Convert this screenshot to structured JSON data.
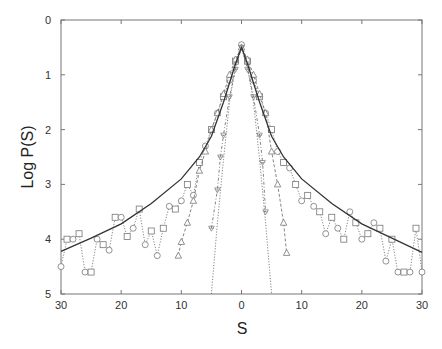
{
  "chart_data": {
    "type": "line",
    "title": "",
    "xlabel": "S",
    "ylabel": "Log P(S)",
    "xlim": [
      -30,
      30
    ],
    "ylim": [
      0,
      5
    ],
    "y_inverted": true,
    "x_tick_values": [
      -30,
      -20,
      -10,
      0,
      10,
      20,
      30
    ],
    "x_tick_labels": [
      "30",
      "20",
      "10",
      "0",
      "10",
      "20",
      "30"
    ],
    "y_tick_values": [
      0,
      1,
      2,
      3,
      4,
      5
    ],
    "y_tick_labels": [
      "0",
      "1",
      "2",
      "3",
      "4",
      "5"
    ],
    "grid": false,
    "legend": null,
    "series": [
      {
        "name": "fit (solid line)",
        "style": "solid",
        "marker": "none",
        "x": [
          -30,
          -25,
          -20,
          -15,
          -10,
          -7,
          -5,
          -3,
          -2,
          -1,
          0,
          1,
          2,
          3,
          5,
          7,
          10,
          15,
          20,
          25,
          30
        ],
        "y": [
          4.22,
          3.98,
          3.72,
          3.35,
          2.9,
          2.5,
          2.12,
          1.5,
          1.15,
          0.8,
          0.5,
          0.8,
          1.15,
          1.5,
          2.12,
          2.5,
          2.9,
          3.35,
          3.72,
          3.98,
          4.24
        ]
      },
      {
        "name": "circles/squares data",
        "style": "dotted",
        "marker": "circle-square",
        "x": [
          -30,
          -29,
          -28,
          -27,
          -26,
          -25,
          -24,
          -23,
          -22,
          -21,
          -20,
          -19,
          -18,
          -17,
          -16,
          -15,
          -14,
          -13,
          -12,
          -11,
          -10,
          -9,
          -8,
          -7,
          -6,
          -5,
          -4,
          -3,
          -2,
          -1,
          0,
          1,
          2,
          3,
          4,
          5,
          6,
          7,
          8,
          9,
          10,
          11,
          12,
          13,
          14,
          15,
          16,
          17,
          18,
          19,
          20,
          21,
          22,
          23,
          24,
          25,
          26,
          27,
          28,
          29,
          30
        ],
        "y": [
          4.5,
          4.0,
          4.0,
          3.9,
          4.6,
          4.6,
          4.0,
          4.1,
          4.2,
          3.6,
          3.6,
          3.95,
          3.8,
          3.45,
          4.1,
          3.85,
          4.3,
          3.8,
          3.4,
          3.45,
          3.3,
          3.0,
          3.2,
          2.6,
          2.3,
          2.0,
          1.7,
          1.4,
          1.1,
          0.75,
          0.45,
          0.75,
          1.1,
          1.4,
          1.7,
          2.0,
          2.4,
          2.6,
          2.7,
          3.0,
          3.3,
          3.2,
          3.4,
          3.5,
          3.9,
          3.6,
          3.8,
          4.0,
          3.5,
          3.7,
          4.0,
          3.9,
          3.7,
          3.8,
          4.4,
          4.0,
          4.6,
          4.6,
          4.6,
          3.8,
          4.6
        ]
      },
      {
        "name": "triangles data",
        "style": "dashed",
        "marker": "triangle-up",
        "x": [
          -10.5,
          -10,
          -9,
          -8,
          -7,
          -6,
          -5,
          -4,
          -3,
          -2,
          -1,
          0,
          1,
          2,
          3,
          4,
          5,
          6,
          7,
          7.5
        ],
        "y": [
          4.3,
          4.05,
          3.7,
          3.3,
          2.75,
          2.4,
          2.0,
          1.7,
          1.35,
          1.0,
          0.72,
          0.5,
          0.72,
          1.0,
          1.35,
          1.7,
          2.4,
          3.0,
          3.7,
          4.25
        ]
      },
      {
        "name": "inverted triangles / crosses data",
        "style": "dash-dot",
        "marker": "triangle-down",
        "x": [
          -5,
          -4,
          -3.5,
          -3,
          -2,
          -1,
          0,
          1,
          2,
          3,
          3.5,
          4
        ],
        "y": [
          3.8,
          3.1,
          2.5,
          2.1,
          1.4,
          0.9,
          0.5,
          0.9,
          1.4,
          2.1,
          2.6,
          3.5
        ]
      },
      {
        "name": "gaussian (dotted line)",
        "style": "dotted",
        "marker": "none",
        "x": [
          -5,
          -4,
          -3,
          -2,
          -1,
          0,
          1,
          2,
          3,
          4,
          5
        ],
        "y": [
          5.0,
          3.7,
          2.55,
          1.5,
          0.85,
          0.5,
          0.85,
          1.5,
          2.55,
          3.7,
          5.0
        ]
      }
    ]
  }
}
